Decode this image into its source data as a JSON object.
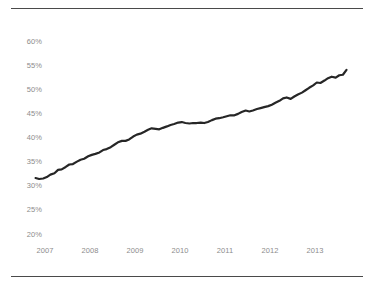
{
  "figure": {
    "name": "line-chart-figure",
    "top_rule": "",
    "bottom_rule": ""
  },
  "chart_data": {
    "type": "line",
    "title": "",
    "subtitle": "",
    "xlabel": "",
    "ylabel": "",
    "grid": false,
    "legend": null,
    "line_color": "#262626",
    "line_width": 2.2,
    "xlim": [
      2006.75,
      2013.85
    ],
    "ylim": [
      20,
      62
    ],
    "yticks": [
      20,
      25,
      30,
      35,
      40,
      45,
      50,
      55,
      60
    ],
    "ytick_labels": [
      "20%",
      "25%",
      "30%",
      "35%",
      "40%",
      "45%",
      "50%",
      "55%",
      "60%"
    ],
    "xticks": [
      2007,
      2008,
      2009,
      2010,
      2011,
      2012,
      2013
    ],
    "xtick_labels": [
      "2007",
      "2008",
      "2009",
      "2010",
      "2011",
      "2012",
      "2013"
    ],
    "x": [
      2006.79,
      2006.87,
      2006.96,
      2007.04,
      2007.12,
      2007.21,
      2007.29,
      2007.37,
      2007.46,
      2007.54,
      2007.62,
      2007.71,
      2007.79,
      2007.87,
      2007.96,
      2008.04,
      2008.12,
      2008.21,
      2008.29,
      2008.37,
      2008.46,
      2008.54,
      2008.62,
      2008.71,
      2008.79,
      2008.87,
      2008.96,
      2009.04,
      2009.12,
      2009.21,
      2009.29,
      2009.37,
      2009.46,
      2009.54,
      2009.62,
      2009.71,
      2009.79,
      2009.87,
      2009.96,
      2010.04,
      2010.12,
      2010.21,
      2010.29,
      2010.37,
      2010.46,
      2010.54,
      2010.62,
      2010.71,
      2010.79,
      2010.87,
      2010.96,
      2011.04,
      2011.12,
      2011.21,
      2011.29,
      2011.37,
      2011.46,
      2011.54,
      2011.62,
      2011.71,
      2011.79,
      2011.87,
      2011.96,
      2012.04,
      2012.12,
      2012.21,
      2012.29,
      2012.37,
      2012.46,
      2012.54,
      2012.62,
      2012.71,
      2012.79,
      2012.87,
      2012.96,
      2013.04,
      2013.12,
      2013.21,
      2013.29,
      2013.37,
      2013.46,
      2013.54,
      2013.62,
      2013.7
    ],
    "values": [
      31.6,
      31.4,
      31.5,
      31.8,
      32.3,
      32.6,
      33.3,
      33.4,
      33.9,
      34.4,
      34.5,
      35.0,
      35.4,
      35.6,
      36.1,
      36.4,
      36.6,
      36.9,
      37.4,
      37.6,
      38.0,
      38.5,
      39.0,
      39.3,
      39.3,
      39.6,
      40.2,
      40.6,
      40.8,
      41.2,
      41.6,
      41.9,
      41.8,
      41.7,
      42.0,
      42.3,
      42.6,
      42.8,
      43.1,
      43.2,
      43.0,
      42.9,
      43.0,
      43.0,
      43.1,
      43.0,
      43.2,
      43.6,
      43.9,
      44.0,
      44.2,
      44.4,
      44.6,
      44.6,
      44.9,
      45.3,
      45.6,
      45.4,
      45.6,
      45.9,
      46.1,
      46.3,
      46.5,
      46.8,
      47.2,
      47.6,
      48.1,
      48.3,
      48.0,
      48.5,
      48.9,
      49.3,
      49.8,
      50.3,
      50.8,
      51.4,
      51.3,
      51.8,
      52.3,
      52.6,
      52.4,
      52.9,
      53.0,
      54.0
    ],
    "series": [
      {
        "name": "series-1",
        "values": [
          31.6,
          31.4,
          31.5,
          31.8,
          32.3,
          32.6,
          33.3,
          33.4,
          33.9,
          34.4,
          34.5,
          35.0,
          35.4,
          35.6,
          36.1,
          36.4,
          36.6,
          36.9,
          37.4,
          37.6,
          38.0,
          38.5,
          39.0,
          39.3,
          39.3,
          39.6,
          40.2,
          40.6,
          40.8,
          41.2,
          41.6,
          41.9,
          41.8,
          41.7,
          42.0,
          42.3,
          42.6,
          42.8,
          43.1,
          43.2,
          43.0,
          42.9,
          43.0,
          43.0,
          43.1,
          43.0,
          43.2,
          43.6,
          43.9,
          44.0,
          44.2,
          44.4,
          44.6,
          44.6,
          44.9,
          45.3,
          45.6,
          45.4,
          45.6,
          45.9,
          46.1,
          46.3,
          46.5,
          46.8,
          47.2,
          47.6,
          48.1,
          48.3,
          48.0,
          48.5,
          48.9,
          49.3,
          49.8,
          50.3,
          50.8,
          51.4,
          51.3,
          51.8,
          52.3,
          52.6,
          52.4,
          52.9,
          53.0,
          54.0
        ]
      }
    ],
    "start_value": 31.6,
    "end_value": 54.0,
    "min_value": 31.4,
    "max_value": 54.0
  }
}
